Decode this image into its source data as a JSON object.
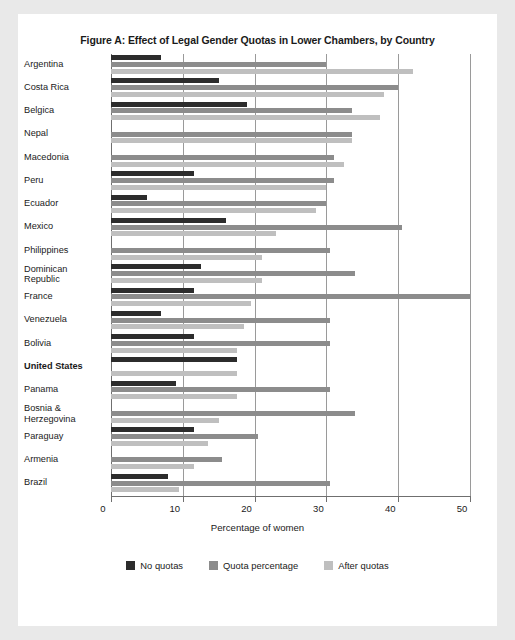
{
  "figure": {
    "title": "Figure A: Effect of Legal Gender Quotas in Lower Chambers, by Country",
    "background_color": "#e9e9e9",
    "panel_color": "#ffffff"
  },
  "axis": {
    "x_title": "Percentage of women",
    "x_ticks": [
      "0",
      "10",
      "20",
      "30",
      "40",
      "50"
    ]
  },
  "legend": {
    "items": [
      {
        "label": "No quotas",
        "color": "#2c2c2c"
      },
      {
        "label": "Quota percentage",
        "color": "#8c8c8c"
      },
      {
        "label": "After quotas",
        "color": "#bfbfbf"
      }
    ]
  },
  "chart_data": {
    "type": "bar",
    "orientation": "horizontal",
    "title": "Figure A: Effect of Legal Gender Quotas in Lower Chambers, by Country",
    "xlabel": "Percentage of women",
    "ylabel": "",
    "xlim": [
      0,
      50
    ],
    "xticks": [
      0,
      10,
      20,
      30,
      40,
      50
    ],
    "grid": true,
    "legend_position": "bottom",
    "categories": [
      "Argentina",
      "Costa Rica",
      "Belgica",
      "Nepal",
      "Macedonia",
      "Peru",
      "Ecuador",
      "Mexico",
      "Philippines",
      "Dominican Republic",
      "France",
      "Venezuela",
      "Bolivia",
      "United States",
      "Panama",
      "Bosnia & Herzegovina",
      "Paraguay",
      "Armenia",
      "Brazil"
    ],
    "highlighted_category": "United States",
    "series": [
      {
        "name": "No quotas",
        "color": "#2c2c2c",
        "values": [
          7,
          15,
          19,
          0,
          0,
          11.5,
          5,
          16,
          0,
          12.5,
          11.5,
          7,
          11.5,
          17.5,
          9,
          0,
          11.5,
          0,
          8
        ]
      },
      {
        "name": "Quota percentage",
        "color": "#8c8c8c",
        "values": [
          30,
          40,
          33.5,
          33.5,
          31,
          31,
          30,
          40.5,
          30.5,
          34,
          50,
          30.5,
          30.5,
          0,
          30.5,
          34,
          20.5,
          15.5,
          30.5
        ]
      },
      {
        "name": "After quotas",
        "color": "#bfbfbf",
        "values": [
          42,
          38,
          37.5,
          33.5,
          32.5,
          30,
          28.5,
          23,
          21,
          21,
          19.5,
          18.5,
          17.5,
          17.5,
          17.5,
          15,
          13.5,
          11.5,
          9.5
        ]
      }
    ]
  }
}
